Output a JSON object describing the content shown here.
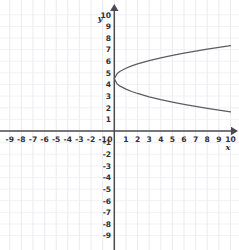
{
  "figure": {
    "kind": "cartesian-graph",
    "background_color": "#ffffff",
    "grid_color": "#e2e2ea",
    "axis_color": "#4a4a52",
    "curve_color": "#5c5c66",
    "label_color": "#303038"
  },
  "axes": {
    "x_name": "x",
    "y_name": "y",
    "x_tick_labels": [
      "-9",
      "-8",
      "-7",
      "-6",
      "-5",
      "-4",
      "-3",
      "-2",
      "-1",
      "0",
      "1",
      "2",
      "3",
      "4",
      "5",
      "6",
      "7",
      "8",
      "9",
      "10"
    ],
    "y_tick_labels_positive": [
      "10",
      "9",
      "8",
      "7",
      "6",
      "5",
      "4",
      "3",
      "2",
      "1"
    ],
    "y_tick_labels_negative": [
      "-1",
      "-2",
      "-3",
      "-4",
      "-5",
      "-6",
      "-7",
      "-8",
      "-9"
    ],
    "origin_label": "0"
  },
  "chart_data": {
    "type": "line",
    "title": "",
    "xlabel": "x",
    "ylabel": "y",
    "xlim": [
      -9.5,
      10.5
    ],
    "ylim": [
      -9.5,
      10.5
    ],
    "xticks": [
      -9,
      -8,
      -7,
      -6,
      -5,
      -4,
      -3,
      -2,
      -1,
      0,
      1,
      2,
      3,
      4,
      5,
      6,
      7,
      8,
      9,
      10
    ],
    "yticks": [
      -9,
      -8,
      -7,
      -6,
      -5,
      -4,
      -3,
      -2,
      -1,
      0,
      1,
      2,
      3,
      4,
      5,
      6,
      7,
      8,
      9,
      10
    ],
    "grid": true,
    "legend": "none",
    "equation": "y = 4.5 +/- 0.9*sqrt(x)",
    "vertex": [
      0,
      4.5
    ],
    "series": [
      {
        "name": "upper branch",
        "x": [
          0,
          0.25,
          0.5,
          1,
          1.5,
          2,
          3,
          4,
          5,
          6,
          7,
          8,
          9,
          10
        ],
        "y": [
          4.5,
          4.95,
          5.14,
          5.4,
          5.6,
          5.77,
          6.06,
          6.3,
          6.51,
          6.7,
          6.88,
          7.05,
          7.2,
          7.35
        ]
      },
      {
        "name": "lower branch",
        "x": [
          0,
          0.25,
          0.5,
          1,
          1.5,
          2,
          3,
          4,
          5,
          6,
          7,
          8,
          9,
          10
        ],
        "y": [
          4.5,
          4.05,
          3.86,
          3.6,
          3.4,
          3.23,
          2.94,
          2.7,
          2.49,
          2.3,
          2.12,
          1.95,
          1.8,
          1.65
        ]
      }
    ]
  }
}
